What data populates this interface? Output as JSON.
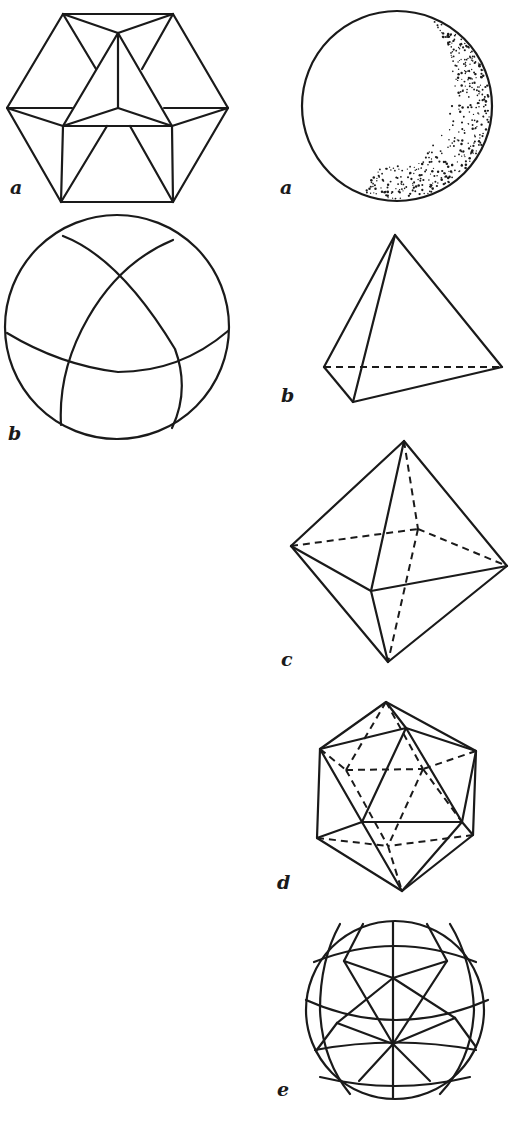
{
  "figures": [
    {
      "id": "cuboctahedron",
      "label": "a",
      "column": "left"
    },
    {
      "id": "spherical-cuboctahedron",
      "label": "b",
      "column": "left"
    },
    {
      "id": "dotted-sphere",
      "label": "a",
      "column": "right"
    },
    {
      "id": "tetrahedron",
      "label": "b",
      "column": "right"
    },
    {
      "id": "octahedron",
      "label": "c",
      "column": "right"
    },
    {
      "id": "icosahedron",
      "label": "d",
      "column": "right"
    },
    {
      "id": "geodesic-sphere",
      "label": "e",
      "column": "right"
    }
  ],
  "colors": {
    "ink": "#1a1a1a",
    "paper": "#ffffff"
  }
}
